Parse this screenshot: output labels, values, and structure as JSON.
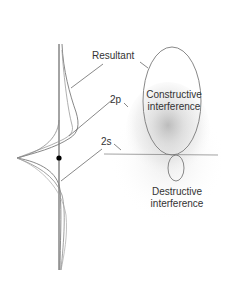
{
  "diagram": {
    "labels": {
      "resultant": "Resultant",
      "orbital_2p": "2p",
      "orbital_2s": "2s",
      "constructive_line1": "Constructive",
      "constructive_line2": "interference",
      "destructive_line1": "Destructive",
      "destructive_line2": "interference"
    },
    "colors": {
      "curve": "#7a7a7a",
      "axis": "#333333",
      "nucleus": "#000000",
      "halo": "#d9d9d9",
      "text": "#333333"
    }
  }
}
